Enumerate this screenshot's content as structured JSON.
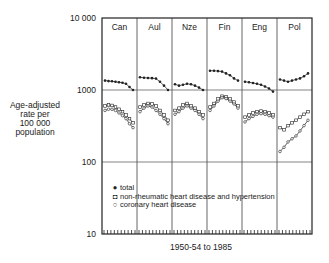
{
  "chart_data": {
    "type": "line",
    "title": "",
    "ylabel": "Age-adjusted rate per 100 000 population",
    "xlabel": "1950-54 to 1985",
    "yscale": "log",
    "ylim": [
      10,
      10000
    ],
    "yticks": [
      "10",
      "100",
      "1000",
      "10 000"
    ],
    "grid": true,
    "panels": [
      "Can",
      "Aul",
      "Nze",
      "Fin",
      "Eng",
      "Pol"
    ],
    "legend": [
      {
        "symbol": "filled-circle",
        "label": "total"
      },
      {
        "symbol": "open-square",
        "label": "non-rheumatic heart disease and hypertension"
      },
      {
        "symbol": "open-circle",
        "label": "coronary heart disease"
      }
    ],
    "series": [
      {
        "name": "total",
        "panel_values": {
          "Can": [
            1350,
            1330,
            1320,
            1300,
            1280,
            1260,
            1220,
            1100,
            1000
          ],
          "Aul": [
            1500,
            1480,
            1470,
            1460,
            1440,
            1300,
            1150,
            1000
          ],
          "Nze": [
            1200,
            1150,
            1180,
            1220,
            1200,
            1150,
            1080,
            1000
          ],
          "Fin": [
            1850,
            1850,
            1830,
            1800,
            1700,
            1600,
            1450,
            1350
          ],
          "Eng": [
            1300,
            1280,
            1250,
            1220,
            1180,
            1120,
            1050,
            950
          ],
          "Pol": [
            1400,
            1350,
            1300,
            1350,
            1400,
            1450,
            1550,
            1700
          ]
        }
      },
      {
        "name": "non-rheumatic heart disease and hypertension",
        "panel_values": {
          "Can": [
            600,
            620,
            610,
            580,
            540,
            500,
            450,
            400,
            350
          ],
          "Aul": [
            580,
            620,
            650,
            640,
            600,
            520,
            450,
            380
          ],
          "Nze": [
            520,
            560,
            620,
            650,
            600,
            560,
            500,
            450
          ],
          "Fin": [
            580,
            650,
            750,
            820,
            800,
            750,
            680,
            600
          ],
          "Eng": [
            420,
            450,
            480,
            500,
            510,
            500,
            480,
            450
          ],
          "Pol": [
            300,
            280,
            320,
            350,
            380,
            420,
            460,
            500
          ]
        }
      },
      {
        "name": "coronary heart disease",
        "panel_values": {
          "Can": [
            520,
            540,
            540,
            520,
            480,
            440,
            400,
            340,
            300
          ],
          "Aul": [
            500,
            560,
            600,
            580,
            520,
            460,
            400,
            340
          ],
          "Nze": [
            460,
            500,
            560,
            600,
            560,
            520,
            460,
            400
          ],
          "Fin": [
            520,
            600,
            700,
            780,
            760,
            700,
            640,
            560
          ],
          "Eng": [
            360,
            400,
            430,
            460,
            470,
            460,
            440,
            420
          ],
          "Pol": [
            140,
            160,
            190,
            210,
            230,
            270,
            320,
            380
          ]
        }
      }
    ]
  },
  "axis": {
    "ylabel_lines": [
      "Age-adjusted",
      "rate per",
      "100 000",
      "population"
    ],
    "yticks": [
      {
        "label": "10 000",
        "value": 10000
      },
      {
        "label": "1000",
        "value": 1000
      },
      {
        "label": "100",
        "value": 100
      },
      {
        "label": "10",
        "value": 10
      }
    ],
    "xlabel": "1950-54 to 1985"
  },
  "legend": {
    "total_symbol": "●",
    "total": "total",
    "nonrheum_symbol": "◘",
    "nonrheum": "non-rheumatic heart disease and hypertension",
    "coronary_symbol": "○",
    "coronary": "coronary heart disease"
  }
}
